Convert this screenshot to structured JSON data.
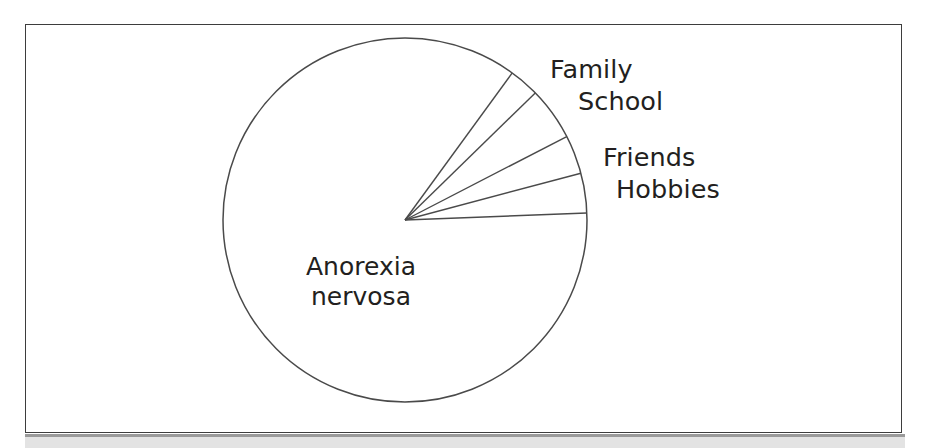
{
  "figure": {
    "background_color": "#ffffff",
    "frame_color": "#3d3d3d",
    "line_color": "#4a4a4a",
    "text_color": "#231f20"
  },
  "chart_data": {
    "type": "pie",
    "title": "",
    "subtitle": "",
    "xlabel": "",
    "ylabel": "",
    "grid": false,
    "legend_position": "none",
    "label_placement": "outside-right",
    "center": {
      "x": 405,
      "y": 220
    },
    "radius": 182,
    "start_angle_deg": 2.2,
    "direction": "counterclockwise",
    "categories": [
      "Anorexia nervosa",
      "Family",
      "School",
      "Friends",
      "Hobbies"
    ],
    "values": [
      85.6,
      2.7,
      4.7,
      3.4,
      3.5
    ],
    "slices": [
      {
        "label": "Anorexia nervosa",
        "label_line_1": "Anorexia",
        "label_line_2": "nervosa",
        "percent": 85.6,
        "angle_deg": 308.3,
        "start_deg": 53.9,
        "end_deg": 362.2,
        "label_position": "inside"
      },
      {
        "label": "Family",
        "percent": 2.7,
        "angle_deg": 9.6,
        "start_deg": 44.3,
        "end_deg": 53.9,
        "label_position": "outside"
      },
      {
        "label": "School",
        "percent": 4.7,
        "angle_deg": 17.0,
        "start_deg": 27.3,
        "end_deg": 44.3,
        "label_position": "outside"
      },
      {
        "label": "Friends",
        "percent": 3.4,
        "angle_deg": 12.4,
        "start_deg": 14.9,
        "end_deg": 27.3,
        "label_position": "outside"
      },
      {
        "label": "Hobbies",
        "percent": 3.5,
        "angle_deg": 12.7,
        "start_deg": 2.2,
        "end_deg": 14.9,
        "label_position": "outside"
      }
    ],
    "spoke_endpoints": [
      {
        "label": "Anorexia nervosa / Family boundary",
        "x": 512,
        "y": 73
      },
      {
        "label": "Family / School boundary",
        "x": 545,
        "y": 105
      },
      {
        "label": "School / Friends boundary",
        "x": 572,
        "y": 143
      },
      {
        "label": "Friends / Hobbies boundary",
        "x": 578,
        "y": 178
      },
      {
        "label": "Hobbies / Anorexia nervosa boundary",
        "x": 588,
        "y": 213
      }
    ]
  }
}
